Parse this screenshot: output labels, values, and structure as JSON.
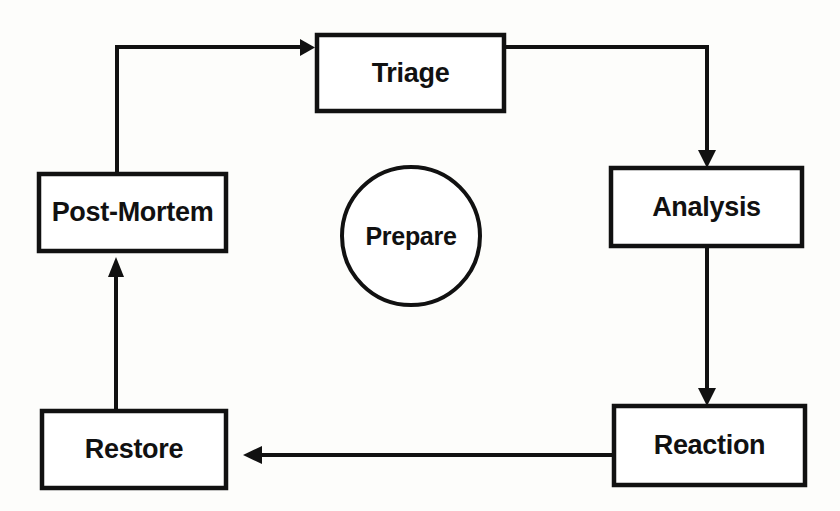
{
  "diagram": {
    "type": "cycle-flowchart",
    "background_color": "#fdfdfb",
    "stroke_color": "#111111",
    "fill_color": "#ffffff",
    "nodes": [
      {
        "id": "triage",
        "label": "Triage",
        "shape": "rectangle",
        "x": 317,
        "y": 35,
        "w": 187,
        "h": 76
      },
      {
        "id": "analysis",
        "label": "Analysis",
        "shape": "rectangle",
        "x": 611,
        "y": 168,
        "w": 191,
        "h": 78
      },
      {
        "id": "reaction",
        "label": "Reaction",
        "shape": "rectangle",
        "x": 614,
        "y": 406,
        "w": 191,
        "h": 79
      },
      {
        "id": "restore",
        "label": "Restore",
        "shape": "rectangle",
        "x": 42,
        "y": 411,
        "w": 184,
        "h": 77
      },
      {
        "id": "post-mortem",
        "label": "Post-Mortem",
        "shape": "rectangle",
        "x": 39,
        "y": 174,
        "w": 187,
        "h": 77
      },
      {
        "id": "prepare",
        "label": "Prepare",
        "shape": "circle",
        "cx": 411,
        "cy": 236,
        "rx": 69,
        "ry": 69
      }
    ],
    "edges": [
      {
        "id": "post-mortem-to-triage",
        "from": "post-mortem",
        "to": "triage",
        "style": "elbow",
        "arrowhead": "end"
      },
      {
        "id": "triage-to-analysis",
        "from": "triage",
        "to": "analysis",
        "style": "elbow",
        "arrowhead": "end"
      },
      {
        "id": "analysis-to-reaction",
        "from": "analysis",
        "to": "reaction",
        "style": "vertical",
        "arrowhead": "end"
      },
      {
        "id": "reaction-to-restore",
        "from": "reaction",
        "to": "restore",
        "style": "horizontal",
        "arrowhead": "end"
      },
      {
        "id": "restore-to-post-mortem",
        "from": "restore",
        "to": "post-mortem",
        "style": "vertical",
        "arrowhead": "end"
      }
    ]
  }
}
